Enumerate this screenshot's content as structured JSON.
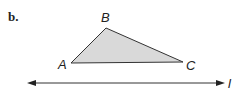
{
  "part_label": "b.",
  "figure": {
    "vertices": [
      {
        "name": "A",
        "x": 71,
        "y": 63
      },
      {
        "name": "B",
        "x": 106,
        "y": 28
      },
      {
        "name": "C",
        "x": 183,
        "y": 62
      }
    ],
    "triangle_fill": "#d9d9d9",
    "stroke_color": "#333333",
    "line": {
      "name": "l",
      "x1": 27,
      "x2": 225,
      "y": 83
    }
  },
  "labels": {
    "A": "A",
    "B": "B",
    "C": "C",
    "line": "l"
  }
}
